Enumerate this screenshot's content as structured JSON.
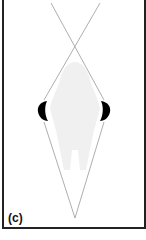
{
  "figure": {
    "panel_label": "(c)",
    "colors": {
      "border": "#222222",
      "lines": "#999999",
      "silhouette": "#f0f0f0",
      "blobs": "#000000"
    }
  }
}
